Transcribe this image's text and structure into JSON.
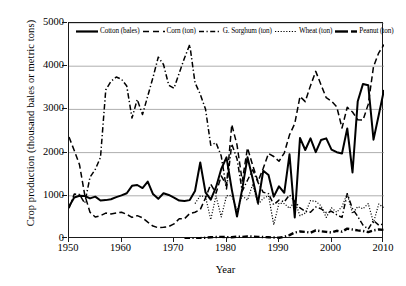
{
  "chart_data": {
    "type": "line",
    "title": "",
    "xlabel": "Year",
    "ylabel": "Crop production (thousand bales or metric tons)",
    "xlim": [
      1950,
      2010
    ],
    "ylim": [
      0,
      5000
    ],
    "xticks": [
      1950,
      1960,
      1970,
      1980,
      1990,
      2000,
      2010
    ],
    "yticks": [
      0,
      1000,
      2000,
      3000,
      4000,
      5000
    ],
    "grid": "horizontal",
    "legend_position": "top-inside",
    "x": [
      1950,
      1951,
      1952,
      1953,
      1954,
      1955,
      1956,
      1957,
      1958,
      1959,
      1960,
      1961,
      1962,
      1963,
      1964,
      1965,
      1966,
      1967,
      1968,
      1969,
      1970,
      1971,
      1972,
      1973,
      1974,
      1975,
      1976,
      1977,
      1978,
      1979,
      1980,
      1981,
      1982,
      1983,
      1984,
      1985,
      1986,
      1987,
      1988,
      1989,
      1990,
      1991,
      1992,
      1993,
      1994,
      1995,
      1996,
      1997,
      1998,
      1999,
      2000,
      2001,
      2002,
      2003,
      2004,
      2005,
      2006,
      2007,
      2008,
      2009,
      2010
    ],
    "series": [
      {
        "name": "Cotton (bales)",
        "style": "solid",
        "width": 2.0,
        "color": "#000000",
        "values": [
          750,
          960,
          1000,
          995,
          940,
          980,
          890,
          900,
          920,
          970,
          1010,
          1060,
          1230,
          1250,
          1180,
          1330,
          1040,
          930,
          1060,
          1020,
          960,
          890,
          880,
          900,
          1110,
          1770,
          1080,
          910,
          1200,
          1620,
          1890,
          1150,
          520,
          1160,
          1890,
          1390,
          830,
          1580,
          1480,
          980,
          1220,
          1070,
          1960,
          500,
          2340,
          2060,
          2330,
          2010,
          2290,
          2330,
          2070,
          2010,
          1980,
          2560,
          1540,
          3190,
          3590,
          3560,
          2300,
          2870,
          3450
        ]
      },
      {
        "name": "Corn (ton)",
        "style": "dashed",
        "width": 1.5,
        "color": "#000000",
        "values": [
          2360,
          2050,
          1720,
          1020,
          620,
          510,
          540,
          600,
          580,
          600,
          620,
          570,
          500,
          540,
          490,
          390,
          300,
          260,
          270,
          290,
          350,
          470,
          470,
          590,
          620,
          680,
          950,
          1270,
          1060,
          1460,
          1240,
          2650,
          2180,
          1340,
          2110,
          1700,
          1330,
          1640,
          1980,
          1910,
          1800,
          1990,
          2410,
          2670,
          3300,
          3180,
          3550,
          3880,
          3570,
          3270,
          3190,
          3060,
          2570,
          3050,
          2940,
          2760,
          2750,
          3120,
          3990,
          4310,
          4500
        ]
      },
      {
        "name": "G. Sorghum (ton)",
        "style": "dashdot",
        "width": 1.5,
        "color": "#000000",
        "values": [
          710,
          1040,
          1030,
          830,
          1430,
          1610,
          1890,
          3450,
          3650,
          3750,
          3700,
          3540,
          2800,
          3230,
          2880,
          3310,
          3740,
          4210,
          4040,
          3560,
          3490,
          3840,
          4190,
          4500,
          3620,
          3350,
          3010,
          2170,
          2230,
          1920,
          1160,
          2200,
          1860,
          1110,
          1360,
          1600,
          1310,
          1080,
          1050,
          790,
          900,
          860,
          1020,
          870,
          720,
          640,
          620,
          740,
          700,
          610,
          640,
          560,
          500,
          1050,
          700,
          520,
          320,
          230,
          430,
          320,
          350
        ]
      },
      {
        "name": "Wheat (ton)",
        "style": "dotted",
        "width": 1.2,
        "color": "#000000",
        "values": [
          null,
          null,
          null,
          null,
          null,
          null,
          null,
          null,
          null,
          null,
          null,
          null,
          null,
          null,
          null,
          null,
          null,
          null,
          null,
          null,
          null,
          null,
          null,
          null,
          820,
          1000,
          980,
          450,
          1000,
          510,
          1000,
          1010,
          660,
          1000,
          900,
          1270,
          800,
          940,
          1000,
          330,
          830,
          820,
          710,
          870,
          540,
          600,
          890,
          870,
          770,
          500,
          720,
          620,
          750,
          1050,
          590,
          750,
          700,
          820,
          380,
          810,
          720
        ]
      },
      {
        "name": "Peanut (ton)",
        "style": "dashdot",
        "width": 2.4,
        "color": "#000000",
        "values": [
          null,
          null,
          null,
          null,
          null,
          null,
          null,
          null,
          null,
          null,
          null,
          null,
          null,
          null,
          null,
          null,
          null,
          null,
          null,
          null,
          null,
          null,
          0,
          5,
          10,
          20,
          30,
          40,
          45,
          50,
          45,
          40,
          55,
          50,
          60,
          55,
          50,
          45,
          40,
          35,
          30,
          50,
          90,
          150,
          175,
          165,
          145,
          200,
          180,
          165,
          150,
          190,
          170,
          240,
          220,
          200,
          185,
          160,
          200,
          220,
          210
        ]
      }
    ]
  },
  "legend": {
    "items": [
      {
        "label": "Cotton (bales)",
        "icon": "solid-line-swatch"
      },
      {
        "label": "Corn (ton)",
        "icon": "dashed-line-swatch"
      },
      {
        "label": "G. Sorghum (ton)",
        "icon": "dashdot-line-swatch"
      },
      {
        "label": "Wheat (ton)",
        "icon": "dotted-line-swatch"
      },
      {
        "label": "Peanut (ton)",
        "icon": "thick-dashdot-line-swatch"
      }
    ]
  },
  "axes": {
    "y_title": "Crop production (thousand bales or metric tons)",
    "x_title": "Year",
    "y_tick_labels": [
      "5000",
      "4000",
      "3000",
      "2000",
      "1000",
      "0"
    ],
    "x_tick_labels": [
      "1950",
      "1960",
      "1970",
      "1980",
      "1990",
      "2000",
      "2010"
    ]
  },
  "colors": {
    "axis": "#1a1a1a",
    "grid": "#8c8c8c",
    "line": "#000000",
    "background": "#ffffff"
  }
}
